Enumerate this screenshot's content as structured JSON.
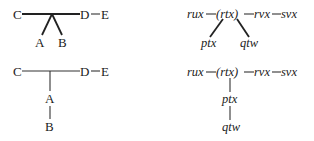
{
  "diagrams": [
    {
      "id": "top-left",
      "nodes": {
        "C": "C",
        "D": "D",
        "E": "E",
        "A": "A",
        "B": "B"
      },
      "edges": [
        [
          "C",
          "D"
        ],
        [
          "D",
          "E"
        ],
        [
          "junction",
          "A"
        ],
        [
          "junction",
          "B"
        ]
      ]
    },
    {
      "id": "top-right",
      "nodes": {
        "rux": "rux",
        "rtx": "(rtx)",
        "rvx": "rvx",
        "svx": "svx",
        "ptx": "ptx",
        "qtw": "qtw"
      },
      "edges": [
        [
          "rux",
          "rtx"
        ],
        [
          "rtx",
          "rvx"
        ],
        [
          "rvx",
          "svx"
        ],
        [
          "rtx",
          "ptx"
        ],
        [
          "rtx",
          "qtw"
        ]
      ]
    },
    {
      "id": "bottom-left",
      "nodes": {
        "C": "C",
        "D": "D",
        "E": "E",
        "A": "A",
        "B": "B"
      },
      "edges": [
        [
          "C",
          "D"
        ],
        [
          "D",
          "E"
        ],
        [
          "junction",
          "A"
        ],
        [
          "A",
          "B"
        ]
      ]
    },
    {
      "id": "bottom-right",
      "nodes": {
        "rux": "rux",
        "rtx": "(rtx)",
        "rvx": "rvx",
        "svx": "svx",
        "ptx": "ptx",
        "qtw": "qtw"
      },
      "edges": [
        [
          "rux",
          "rtx"
        ],
        [
          "rtx",
          "rvx"
        ],
        [
          "rvx",
          "svx"
        ],
        [
          "rtx",
          "ptx"
        ],
        [
          "ptx",
          "qtw"
        ]
      ]
    }
  ]
}
